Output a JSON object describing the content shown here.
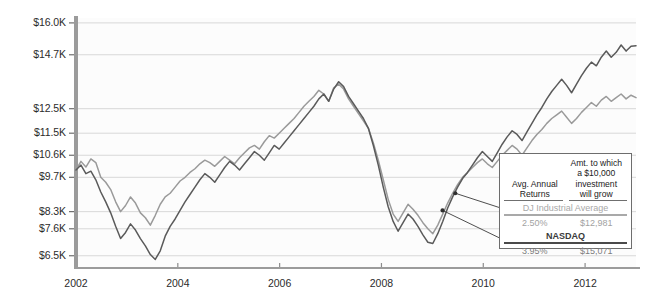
{
  "chart_data": {
    "type": "line",
    "title": "",
    "xlabel": "",
    "ylabel": "",
    "grid": true,
    "legend_position": "inside-bottom-right",
    "xlim": [
      2002,
      2013
    ],
    "ylim": [
      6000,
      16200
    ],
    "x_tick_labels": [
      "2002",
      "2004",
      "2006",
      "2008",
      "2010",
      "2012"
    ],
    "x_tick_values": [
      2002,
      2004,
      2006,
      2008,
      2010,
      2012
    ],
    "y_tick_labels": [
      "$16.0K",
      "$14.7K",
      "$12.5K",
      "$11.5K",
      "$10.6K",
      "$9.7K",
      "$8.3K",
      "$7.6K",
      "$6.5K"
    ],
    "y_tick_values": [
      16000,
      14700,
      12500,
      11500,
      10600,
      9700,
      8300,
      7600,
      6500
    ],
    "series": [
      {
        "name": "DJ Industrial Average",
        "color": "#9a9a9a",
        "values": [
          10000,
          10350,
          10120,
          10450,
          10300,
          9700,
          9500,
          9200,
          8700,
          8300,
          8550,
          8900,
          8650,
          8250,
          8050,
          7750,
          8150,
          8600,
          8900,
          9050,
          9300,
          9550,
          9700,
          9900,
          10050,
          10250,
          10400,
          10300,
          10150,
          10350,
          10550,
          10400,
          10250,
          10500,
          10700,
          10900,
          11000,
          10850,
          11150,
          11400,
          11300,
          11500,
          11700,
          11900,
          12100,
          12350,
          12600,
          12800,
          13000,
          13250,
          13100,
          12800,
          13350,
          13500,
          13300,
          12900,
          12600,
          12300,
          12000,
          11700,
          11100,
          10400,
          9600,
          8800,
          8200,
          7900,
          8250,
          8600,
          8400,
          8150,
          7850,
          7600,
          7400,
          7750,
          8200,
          8650,
          9050,
          9400,
          9700,
          9900,
          10100,
          10300,
          10450,
          10250,
          10100,
          10350,
          10600,
          10800,
          11000,
          10850,
          10600,
          10900,
          11200,
          11450,
          11650,
          11900,
          12100,
          12250,
          12400,
          12150,
          11900,
          12100,
          12350,
          12550,
          12750,
          12600,
          12850,
          13000,
          12800,
          12950,
          13100,
          12900,
          13050,
          12950
        ]
      },
      {
        "name": "NASDAQ",
        "color": "#5a5a5a",
        "values": [
          10000,
          10200,
          9850,
          9950,
          9600,
          9100,
          8700,
          8250,
          7700,
          7200,
          7450,
          7800,
          7550,
          7200,
          6900,
          6550,
          6350,
          6700,
          7300,
          7700,
          8000,
          8350,
          8700,
          9000,
          9300,
          9600,
          9850,
          9700,
          9500,
          9800,
          10100,
          10350,
          10200,
          10000,
          10250,
          10500,
          10750,
          10600,
          10400,
          10700,
          11000,
          10850,
          11100,
          11350,
          11600,
          11850,
          12100,
          12350,
          12600,
          12900,
          13100,
          12800,
          13300,
          13600,
          13400,
          13000,
          12700,
          12400,
          12100,
          11700,
          11000,
          10200,
          9300,
          8500,
          7900,
          7500,
          7850,
          8200,
          8000,
          7700,
          7350,
          7050,
          7000,
          7400,
          7900,
          8450,
          8900,
          9300,
          9650,
          9900,
          10200,
          10500,
          10750,
          10550,
          10350,
          10700,
          11050,
          11350,
          11600,
          11450,
          11200,
          11550,
          11900,
          12250,
          12550,
          12900,
          13200,
          13450,
          13700,
          13450,
          13150,
          13500,
          13850,
          14150,
          14400,
          14250,
          14600,
          14850,
          14600,
          14800,
          15100,
          14850,
          15050,
          15071
        ]
      }
    ],
    "annotations": [
      {
        "label": "DJ Industrial Average callout",
        "point_x": 2009.45,
        "point_y": 9050
      },
      {
        "label": "NASDAQ callout",
        "point_x": 2009.2,
        "point_y": 8350
      }
    ]
  },
  "legend": {
    "header_left": "Avg. Annual\nReturns",
    "header_left_line1": "Avg. Annual",
    "header_left_line2": "Returns",
    "header_right_line1": "Amt. to which",
    "header_right_line2": "a $10,000",
    "header_right_line3": "investment",
    "header_right_line4": "will grow",
    "rows": [
      {
        "series": "DJ Industrial Average",
        "avg_annual_return": "2.50%",
        "growth_amount": "$12,981"
      },
      {
        "series": "NASDAQ",
        "avg_annual_return": "3.95%",
        "growth_amount": "$15,071"
      }
    ]
  },
  "colors": {
    "dj_line": "#9a9a9a",
    "nasdaq_line": "#5a5a5a",
    "axis": "#8c8c8c",
    "gridline": "#d8d8d8",
    "plot_background": "#fcfcfc",
    "legend_border": "#6d6d6d",
    "text": "#2b2b2b"
  }
}
